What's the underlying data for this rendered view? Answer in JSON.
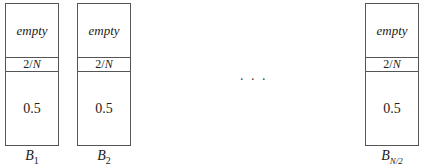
{
  "diagram": {
    "type": "bin-packing",
    "bins": [
      {
        "id": "B1",
        "label_main": "B",
        "label_sub": "1",
        "sub_italic": false,
        "segments": {
          "top": "empty",
          "middle_num": "2/",
          "middle_var": "N",
          "bottom": "0.5"
        }
      },
      {
        "id": "B2",
        "label_main": "B",
        "label_sub": "2",
        "sub_italic": false,
        "segments": {
          "top": "empty",
          "middle_num": "2/",
          "middle_var": "N",
          "bottom": "0.5"
        }
      },
      {
        "id": "BN/2",
        "label_main": "B",
        "label_sub": "N/2",
        "sub_italic": true,
        "segments": {
          "top": "empty",
          "middle_num": "2/",
          "middle_var": "N",
          "bottom": "0.5"
        }
      }
    ],
    "ellipsis": ". . ."
  }
}
